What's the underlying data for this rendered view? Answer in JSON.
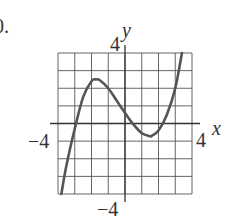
{
  "problem_label": "0.",
  "chart_data": {
    "type": "line",
    "title": "",
    "xlabel": "x",
    "ylabel": "y",
    "xlim": [
      -4,
      4
    ],
    "ylim": [
      -4,
      4
    ],
    "grid": true,
    "grid_step": 1,
    "tick_labels": {
      "x_min": "−4",
      "x_max": "4",
      "y_min": "−4",
      "y_max": "4"
    },
    "series": [
      {
        "name": "curve",
        "x": [
          -3.8,
          -3.5,
          -3.0,
          -2.5,
          -2.0,
          -1.7,
          -1.5,
          -1.0,
          -0.5,
          0.0,
          0.5,
          1.0,
          1.5,
          1.6,
          2.0,
          2.5,
          3.0,
          3.4
        ],
        "y": [
          -4.0,
          -2.4,
          -0.3,
          1.5,
          2.4,
          2.5,
          2.45,
          2.0,
          1.3,
          0.6,
          -0.05,
          -0.55,
          -0.72,
          -0.7,
          -0.4,
          0.5,
          2.0,
          4.0
        ]
      }
    ]
  },
  "colors": {
    "grid": "#555555",
    "curve": "#555555",
    "text": "#333333"
  }
}
